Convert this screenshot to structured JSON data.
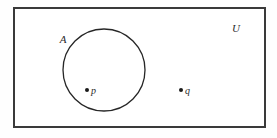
{
  "diagram": {
    "type": "venn-set-diagram",
    "universe": {
      "label": "U",
      "shape": "rectangle",
      "x": 14,
      "y": 8,
      "width": 251,
      "height": 119,
      "label_x": 236,
      "label_y": 32,
      "stroke_color": "#3a3a3a",
      "fill_color": "#ffffff"
    },
    "sets": [
      {
        "label": "A",
        "shape": "circle",
        "cx": 104,
        "cy": 70,
        "r": 41,
        "label_x": 63,
        "label_y": 43,
        "stroke_color": "#262626"
      }
    ],
    "points": [
      {
        "label": "p",
        "x": 87,
        "y": 90,
        "label_x": 91,
        "label_y": 94,
        "radius": 2,
        "inside": "A",
        "color": "#1a1a1a"
      },
      {
        "label": "q",
        "x": 181,
        "y": 90,
        "label_x": 185,
        "label_y": 94,
        "radius": 2,
        "inside": "U",
        "color": "#1a1a1a"
      }
    ]
  },
  "canvas": {
    "width": 277,
    "height": 138,
    "background": "#ffffff"
  }
}
